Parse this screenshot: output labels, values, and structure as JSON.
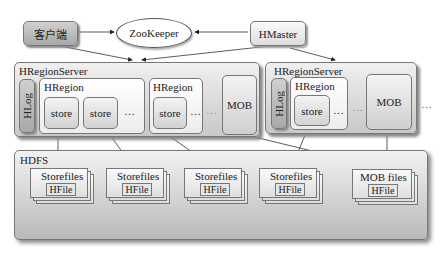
{
  "top": {
    "client": "客户端",
    "zookeeper": "ZooKeeper",
    "hmaster": "HMaster"
  },
  "servers": [
    {
      "title": "HRegionServer",
      "hlog": "HLog",
      "regions": [
        {
          "title": "HRegion",
          "stores": [
            "store",
            "store"
          ],
          "ellipsis": "…"
        },
        {
          "title": "HRegion",
          "stores": [
            "store"
          ],
          "ellipsis": "…"
        }
      ],
      "ellipsis": "…",
      "mob": "MOB"
    },
    {
      "title": "HRegionServer",
      "hlog": "HLog",
      "regions": [
        {
          "title": "HRegion",
          "stores": [
            "store"
          ],
          "ellipsis": "…"
        }
      ],
      "ellipsis": "…",
      "mob": "MOB"
    }
  ],
  "outer_ellipsis": "…",
  "hdfs": {
    "title": "HDFS",
    "files": [
      {
        "label": "Storefiles",
        "inner": "HFile"
      },
      {
        "label": "Storefiles",
        "inner": "HFile"
      },
      {
        "label": "Storefiles",
        "inner": "HFile"
      },
      {
        "label": "Storefiles",
        "inner": "HFile"
      },
      {
        "label": "MOB files",
        "inner": "HFile"
      }
    ]
  }
}
